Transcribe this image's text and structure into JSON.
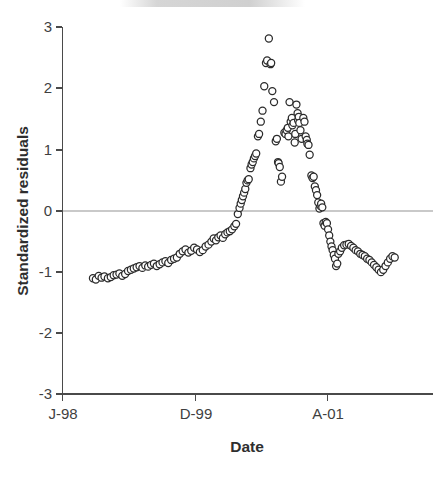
{
  "chart_data": {
    "type": "scatter",
    "title": "",
    "xlabel": "Date",
    "ylabel": "Standardized residuals",
    "ylim": [
      -3,
      3
    ],
    "yticks": [
      3,
      2,
      1,
      0,
      -1,
      -2,
      -3
    ],
    "ytick_labels": [
      "3",
      "2",
      "1",
      "0",
      "-1",
      "-2",
      "-3"
    ],
    "xtick_labels": [
      "J-98",
      "D-99",
      "A-01"
    ],
    "xtick_months": [
      0,
      23,
      46
    ],
    "xlim_months": [
      0,
      65
    ],
    "grid": false,
    "legend": null,
    "marker": "open-circle",
    "marker_color": "#2b2b2b",
    "marker_fill": "#ffffff",
    "zero_reference_line": {
      "y": 0,
      "color": "#c9c9c9"
    },
    "series": [
      {
        "name": "Standardized residuals",
        "points": [
          [
            5.3,
            -1.1
          ],
          [
            5.8,
            -1.12
          ],
          [
            6.3,
            -1.06
          ],
          [
            6.8,
            -1.09
          ],
          [
            7.3,
            -1.07
          ],
          [
            7.9,
            -1.1
          ],
          [
            8.4,
            -1.08
          ],
          [
            8.9,
            -1.05
          ],
          [
            9.4,
            -1.04
          ],
          [
            9.9,
            -1.02
          ],
          [
            10.4,
            -1.06
          ],
          [
            10.9,
            -1.03
          ],
          [
            11.4,
            -0.98
          ],
          [
            11.9,
            -0.96
          ],
          [
            12.4,
            -0.94
          ],
          [
            12.9,
            -0.92
          ],
          [
            13.4,
            -0.9
          ],
          [
            13.9,
            -0.93
          ],
          [
            14.4,
            -0.89
          ],
          [
            14.9,
            -0.91
          ],
          [
            15.4,
            -0.88
          ],
          [
            15.9,
            -0.86
          ],
          [
            16.4,
            -0.9
          ],
          [
            16.9,
            -0.87
          ],
          [
            17.4,
            -0.84
          ],
          [
            17.9,
            -0.82
          ],
          [
            18.4,
            -0.85
          ],
          [
            18.9,
            -0.8
          ],
          [
            19.4,
            -0.78
          ],
          [
            19.9,
            -0.76
          ],
          [
            20.4,
            -0.7
          ],
          [
            20.9,
            -0.66
          ],
          [
            21.4,
            -0.63
          ],
          [
            21.9,
            -0.68
          ],
          [
            22.4,
            -0.65
          ],
          [
            22.9,
            -0.6
          ],
          [
            23.4,
            -0.63
          ],
          [
            23.9,
            -0.67
          ],
          [
            24.4,
            -0.64
          ],
          [
            24.9,
            -0.58
          ],
          [
            25.4,
            -0.55
          ],
          [
            25.9,
            -0.5
          ],
          [
            26.3,
            -0.45
          ],
          [
            26.7,
            -0.48
          ],
          [
            27.1,
            -0.43
          ],
          [
            27.5,
            -0.4
          ],
          [
            27.9,
            -0.44
          ],
          [
            28.3,
            -0.38
          ],
          [
            28.7,
            -0.35
          ],
          [
            29.1,
            -0.33
          ],
          [
            29.5,
            -0.3
          ],
          [
            29.9,
            -0.25
          ],
          [
            30.2,
            -0.21
          ],
          [
            30.5,
            -0.05
          ],
          [
            30.8,
            0.05
          ],
          [
            31.0,
            0.12
          ],
          [
            31.2,
            0.18
          ],
          [
            31.4,
            0.24
          ],
          [
            31.6,
            0.3
          ],
          [
            31.8,
            0.36
          ],
          [
            32.0,
            0.46
          ],
          [
            32.2,
            0.5
          ],
          [
            32.4,
            0.52
          ],
          [
            32.7,
            0.7
          ],
          [
            32.9,
            0.76
          ],
          [
            33.1,
            0.8
          ],
          [
            33.3,
            0.86
          ],
          [
            33.5,
            0.9
          ],
          [
            33.7,
            0.94
          ],
          [
            34.0,
            1.22
          ],
          [
            34.2,
            1.26
          ],
          [
            34.5,
            1.46
          ],
          [
            34.8,
            1.64
          ],
          [
            35.1,
            2.04
          ],
          [
            35.4,
            2.42
          ],
          [
            35.6,
            2.46
          ],
          [
            35.9,
            2.82
          ],
          [
            36.2,
            2.4
          ],
          [
            36.3,
            2.42
          ],
          [
            36.5,
            1.96
          ],
          [
            36.8,
            1.78
          ],
          [
            37.1,
            1.14
          ],
          [
            37.3,
            1.18
          ],
          [
            37.5,
            0.8
          ],
          [
            37.6,
            0.78
          ],
          [
            37.8,
            0.72
          ],
          [
            38.0,
            0.48
          ],
          [
            38.2,
            0.56
          ],
          [
            38.6,
            1.28
          ],
          [
            38.8,
            1.26
          ],
          [
            39.0,
            1.32
          ],
          [
            39.2,
            1.36
          ],
          [
            39.3,
            1.22
          ],
          [
            39.5,
            1.78
          ],
          [
            39.7,
            1.46
          ],
          [
            39.9,
            1.52
          ],
          [
            40.0,
            1.4
          ],
          [
            40.2,
            1.44
          ],
          [
            40.4,
            1.12
          ],
          [
            40.5,
            1.26
          ],
          [
            40.7,
            1.74
          ],
          [
            40.9,
            1.6
          ],
          [
            41.0,
            1.48
          ],
          [
            41.1,
            1.54
          ],
          [
            41.2,
            1.44
          ],
          [
            41.4,
            1.32
          ],
          [
            41.6,
            1.18
          ],
          [
            41.9,
            1.52
          ],
          [
            42.1,
            1.46
          ],
          [
            42.3,
            1.22
          ],
          [
            42.5,
            1.16
          ],
          [
            42.6,
            1.1
          ],
          [
            42.8,
            1.08
          ],
          [
            43.0,
            0.92
          ],
          [
            43.3,
            0.58
          ],
          [
            43.5,
            0.54
          ],
          [
            43.7,
            0.56
          ],
          [
            43.9,
            0.4
          ],
          [
            44.1,
            0.34
          ],
          [
            44.3,
            0.26
          ],
          [
            44.5,
            0.14
          ],
          [
            44.7,
            0.04
          ],
          [
            44.9,
            0.08
          ],
          [
            45.0,
            0.12
          ],
          [
            45.2,
            0.06
          ],
          [
            45.4,
            -0.2
          ],
          [
            45.6,
            -0.24
          ],
          [
            45.8,
            -0.18
          ],
          [
            46.0,
            -0.2
          ],
          [
            46.2,
            -0.3
          ],
          [
            46.4,
            -0.4
          ],
          [
            46.6,
            -0.5
          ],
          [
            46.8,
            -0.58
          ],
          [
            47.0,
            -0.64
          ],
          [
            47.2,
            -0.72
          ],
          [
            47.4,
            -0.78
          ],
          [
            47.6,
            -0.9
          ],
          [
            47.8,
            -0.86
          ],
          [
            48.0,
            -0.7
          ],
          [
            48.3,
            -0.66
          ],
          [
            48.6,
            -0.6
          ],
          [
            49.0,
            -0.56
          ],
          [
            49.4,
            -0.55
          ],
          [
            49.8,
            -0.54
          ],
          [
            50.2,
            -0.57
          ],
          [
            50.6,
            -0.6
          ],
          [
            51.0,
            -0.64
          ],
          [
            51.4,
            -0.66
          ],
          [
            51.8,
            -0.7
          ],
          [
            52.2,
            -0.72
          ],
          [
            52.6,
            -0.74
          ],
          [
            53.0,
            -0.78
          ],
          [
            53.4,
            -0.8
          ],
          [
            53.8,
            -0.84
          ],
          [
            54.2,
            -0.88
          ],
          [
            54.6,
            -0.92
          ],
          [
            55.0,
            -0.96
          ],
          [
            55.4,
            -1.0
          ],
          [
            55.8,
            -0.96
          ],
          [
            56.2,
            -0.9
          ],
          [
            56.6,
            -0.84
          ],
          [
            57.0,
            -0.78
          ],
          [
            57.4,
            -0.74
          ],
          [
            57.8,
            -0.76
          ]
        ]
      }
    ]
  },
  "axes": {
    "y_title": "Standardized residuals",
    "x_title": "Date"
  }
}
